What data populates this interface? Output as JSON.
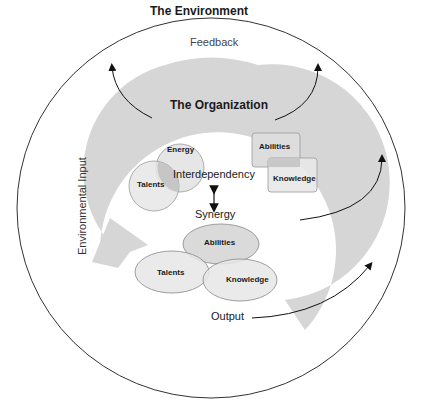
{
  "diagram": {
    "environment_title": "The Environment",
    "organization_title": "The Organization",
    "feedback_label": "Feedback",
    "input_label": "Environmental Input",
    "interdependency_label": "Interdependency",
    "synergy_label": "Synergy",
    "output_label": "Output",
    "upper_left_cluster": {
      "top": "Energy",
      "bottom": "Talents"
    },
    "upper_right_cluster": {
      "top": "Abilities",
      "bottom": "Knowledge"
    },
    "lower_cluster": {
      "top": "Abilities",
      "left": "Talents",
      "right": "Knowledge"
    }
  },
  "colors": {
    "arc_fill": "#d4d4d4",
    "shape_fill": "#e8e8e8",
    "overlap_fill": "#c4c4c4",
    "line": "#222222"
  }
}
